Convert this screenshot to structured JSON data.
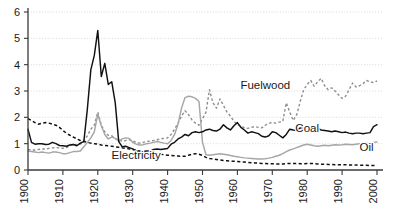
{
  "chart_data": {
    "type": "line",
    "title": "",
    "subtitle": "",
    "xlabel": "",
    "ylabel": "",
    "xlim": [
      1900,
      2000
    ],
    "ylim": [
      0,
      6
    ],
    "yticks": [
      0,
      1,
      2,
      3,
      4,
      5,
      6
    ],
    "ytick_labels": [
      "0",
      "1",
      "2",
      "3",
      "4",
      "5",
      "6"
    ],
    "xticks": [
      1900,
      1910,
      1920,
      1930,
      1940,
      1950,
      1960,
      1970,
      1980,
      1990,
      2000
    ],
    "xtick_labels": [
      "1900",
      "1910",
      "1920",
      "1930",
      "1940",
      "1950",
      "1960",
      "1970",
      "1980",
      "1990",
      "2000"
    ],
    "xtick_rotation": -90,
    "grid": "horizontal-dotted",
    "legend_position": "inline-annotations",
    "annotations": [
      {
        "text": "Fuelwood",
        "x": 1968,
        "y": 3.08,
        "name": "series-label-fuelwood"
      },
      {
        "text": "Coal",
        "x": 1980,
        "y": 1.45,
        "name": "series-label-coal"
      },
      {
        "text": "Oil",
        "x": 1997,
        "y": 0.72,
        "name": "series-label-oil"
      },
      {
        "text": "Electricity",
        "x": 1931,
        "y": 0.4,
        "name": "series-label-electricity"
      }
    ],
    "series": [
      {
        "name": "Coal",
        "style": "solid",
        "color": "#111111",
        "x": [
          1900,
          1901,
          1902,
          1903,
          1904,
          1905,
          1906,
          1907,
          1908,
          1909,
          1910,
          1911,
          1912,
          1913,
          1914,
          1915,
          1916,
          1917,
          1918,
          1919,
          1920,
          1921,
          1922,
          1923,
          1924,
          1925,
          1926,
          1927,
          1928,
          1929,
          1930,
          1931,
          1932,
          1933,
          1934,
          1935,
          1936,
          1937,
          1938,
          1939,
          1940,
          1941,
          1942,
          1943,
          1944,
          1945,
          1946,
          1947,
          1948,
          1949,
          1950,
          1951,
          1952,
          1953,
          1954,
          1955,
          1956,
          1957,
          1958,
          1959,
          1960,
          1961,
          1962,
          1963,
          1964,
          1965,
          1966,
          1967,
          1968,
          1969,
          1970,
          1971,
          1972,
          1973,
          1974,
          1975,
          1976,
          1977,
          1978,
          1979,
          1980,
          1981,
          1982,
          1983,
          1984,
          1985,
          1986,
          1987,
          1988,
          1989,
          1990,
          1991,
          1992,
          1993,
          1994,
          1995,
          1996,
          1997,
          1998,
          1999,
          2000
        ],
        "values": [
          1.55,
          1.05,
          0.98,
          1.0,
          1.0,
          0.97,
          0.98,
          1.05,
          1.0,
          0.93,
          0.92,
          0.9,
          0.95,
          0.97,
          0.92,
          1.02,
          1.08,
          2.3,
          3.8,
          4.35,
          5.3,
          3.55,
          4.05,
          3.25,
          3.35,
          2.55,
          1.08,
          0.88,
          0.9,
          0.85,
          0.8,
          0.72,
          0.7,
          0.7,
          0.72,
          0.72,
          0.78,
          0.8,
          0.78,
          0.8,
          0.82,
          0.98,
          1.05,
          1.18,
          1.25,
          1.35,
          1.3,
          1.42,
          1.45,
          1.42,
          1.45,
          1.52,
          1.55,
          1.5,
          1.48,
          1.55,
          1.72,
          1.6,
          1.52,
          1.68,
          1.8,
          1.62,
          1.52,
          1.4,
          1.45,
          1.42,
          1.38,
          1.28,
          1.25,
          1.3,
          1.45,
          1.42,
          1.32,
          1.22,
          1.35,
          1.55,
          1.52,
          1.5,
          1.6,
          1.58,
          1.48,
          1.6,
          1.65,
          1.58,
          1.52,
          1.5,
          1.48,
          1.45,
          1.48,
          1.45,
          1.42,
          1.44,
          1.4,
          1.38,
          1.4,
          1.4,
          1.38,
          1.4,
          1.42,
          1.65,
          1.72
        ]
      },
      {
        "name": "Oil",
        "style": "solid",
        "color": "#a6a6a6",
        "x": [
          1900,
          1901,
          1902,
          1903,
          1904,
          1905,
          1906,
          1907,
          1908,
          1909,
          1910,
          1911,
          1912,
          1913,
          1914,
          1915,
          1916,
          1917,
          1918,
          1919,
          1920,
          1921,
          1922,
          1923,
          1924,
          1925,
          1926,
          1927,
          1928,
          1929,
          1930,
          1931,
          1932,
          1933,
          1934,
          1935,
          1936,
          1937,
          1938,
          1939,
          1940,
          1941,
          1942,
          1943,
          1944,
          1945,
          1946,
          1947,
          1948,
          1949,
          1950,
          1951,
          1952,
          1953,
          1954,
          1955,
          1956,
          1957,
          1958,
          1959,
          1960,
          1961,
          1962,
          1963,
          1964,
          1965,
          1966,
          1967,
          1968,
          1969,
          1970,
          1971,
          1972,
          1973,
          1974,
          1975,
          1976,
          1977,
          1978,
          1979,
          1980,
          1981,
          1982,
          1983,
          1984,
          1985,
          1986,
          1987,
          1988,
          1989,
          1990,
          1991,
          1992,
          1993,
          1994,
          1995,
          1996,
          1997,
          1998,
          1999,
          2000
        ],
        "values": [
          0.72,
          0.7,
          0.68,
          0.66,
          0.68,
          0.66,
          0.64,
          0.68,
          0.68,
          0.66,
          0.62,
          0.62,
          0.66,
          0.7,
          0.7,
          0.72,
          0.88,
          1.05,
          1.22,
          1.45,
          2.12,
          1.68,
          1.35,
          1.18,
          1.25,
          1.2,
          1.1,
          1.18,
          1.22,
          1.2,
          1.05,
          0.98,
          0.95,
          0.96,
          1.0,
          1.02,
          1.05,
          1.08,
          1.05,
          1.02,
          1.0,
          1.12,
          1.35,
          1.75,
          2.35,
          2.75,
          2.8,
          2.78,
          2.72,
          2.6,
          1.05,
          0.58,
          0.56,
          0.58,
          0.6,
          0.62,
          0.6,
          0.58,
          0.55,
          0.52,
          0.5,
          0.48,
          0.46,
          0.45,
          0.44,
          0.43,
          0.42,
          0.42,
          0.43,
          0.45,
          0.48,
          0.52,
          0.56,
          0.62,
          0.7,
          0.76,
          0.8,
          0.85,
          0.9,
          0.95,
          0.98,
          0.95,
          0.92,
          0.9,
          0.92,
          0.94,
          0.92,
          0.94,
          0.96,
          0.95,
          0.96,
          0.98,
          0.97,
          0.96,
          0.98,
          1.0,
          1.0,
          1.02,
          1.02,
          1.05,
          1.06
        ]
      },
      {
        "name": "Electricity",
        "style": "dashed",
        "color": "#111111",
        "x": [
          1900,
          1901,
          1902,
          1903,
          1904,
          1905,
          1906,
          1907,
          1908,
          1909,
          1910,
          1911,
          1912,
          1913,
          1914,
          1915,
          1916,
          1917,
          1918,
          1919,
          1920,
          1921,
          1922,
          1923,
          1924,
          1925,
          1926,
          1927,
          1928,
          1929,
          1930,
          1931,
          1932,
          1933,
          1934,
          1935,
          1936,
          1937,
          1938,
          1939,
          1940,
          1941,
          1942,
          1943,
          1944,
          1945,
          1946,
          1947,
          1948,
          1949,
          1950,
          1951,
          1952,
          1953,
          1954,
          1955,
          1956,
          1957,
          1958,
          1959,
          1960,
          1961,
          1962,
          1963,
          1964,
          1965,
          1966,
          1967,
          1968,
          1969,
          1970,
          1971,
          1972,
          1973,
          1974,
          1975,
          1976,
          1977,
          1978,
          1979,
          1980,
          1981,
          1982,
          1983,
          1984,
          1985,
          1986,
          1987,
          1988,
          1989,
          1990,
          1991,
          1992,
          1993,
          1994,
          1995,
          1996,
          1997,
          1998,
          1999,
          2000
        ],
        "values": [
          1.95,
          1.88,
          1.8,
          1.74,
          1.78,
          1.8,
          1.78,
          1.74,
          1.7,
          1.62,
          1.5,
          1.4,
          1.32,
          1.25,
          1.18,
          1.12,
          1.08,
          1.05,
          1.02,
          1.0,
          0.98,
          0.95,
          0.93,
          0.92,
          0.9,
          0.88,
          0.86,
          0.84,
          0.82,
          0.8,
          0.78,
          0.75,
          0.72,
          0.7,
          0.68,
          0.66,
          0.64,
          0.62,
          0.6,
          0.58,
          0.56,
          0.55,
          0.54,
          0.53,
          0.52,
          0.52,
          0.56,
          0.6,
          0.62,
          0.6,
          0.55,
          0.48,
          0.44,
          0.42,
          0.4,
          0.38,
          0.36,
          0.35,
          0.34,
          0.33,
          0.32,
          0.31,
          0.3,
          0.29,
          0.28,
          0.27,
          0.26,
          0.25,
          0.25,
          0.24,
          0.24,
          0.23,
          0.23,
          0.23,
          0.24,
          0.25,
          0.25,
          0.25,
          0.24,
          0.24,
          0.25,
          0.25,
          0.24,
          0.23,
          0.22,
          0.22,
          0.21,
          0.21,
          0.2,
          0.2,
          0.2,
          0.2,
          0.19,
          0.19,
          0.19,
          0.18,
          0.18,
          0.18,
          0.17,
          0.17,
          0.17
        ]
      },
      {
        "name": "Fuelwood",
        "style": "dotted",
        "color": "#8f8f8f",
        "x": [
          1900,
          1901,
          1902,
          1903,
          1904,
          1905,
          1906,
          1907,
          1908,
          1909,
          1910,
          1911,
          1912,
          1913,
          1914,
          1915,
          1916,
          1917,
          1918,
          1919,
          1920,
          1921,
          1922,
          1923,
          1924,
          1925,
          1926,
          1927,
          1928,
          1929,
          1930,
          1931,
          1932,
          1933,
          1934,
          1935,
          1936,
          1937,
          1938,
          1939,
          1940,
          1941,
          1942,
          1943,
          1944,
          1945,
          1946,
          1947,
          1948,
          1949,
          1950,
          1951,
          1952,
          1953,
          1954,
          1955,
          1956,
          1957,
          1958,
          1959,
          1960,
          1961,
          1962,
          1963,
          1964,
          1965,
          1966,
          1967,
          1968,
          1969,
          1970,
          1971,
          1972,
          1973,
          1974,
          1975,
          1976,
          1977,
          1978,
          1979,
          1980,
          1981,
          1982,
          1983,
          1984,
          1985,
          1986,
          1987,
          1988,
          1989,
          1990,
          1991,
          1992,
          1993,
          1994,
          1995,
          1996,
          1997,
          1998,
          1999,
          2000
        ],
        "values": [
          0.78,
          0.76,
          0.76,
          0.78,
          0.8,
          0.8,
          0.82,
          0.84,
          0.85,
          0.84,
          0.82,
          0.85,
          0.92,
          0.98,
          0.95,
          0.98,
          1.1,
          1.3,
          1.55,
          1.7,
          2.2,
          1.7,
          1.45,
          1.32,
          1.3,
          1.2,
          1.12,
          1.1,
          1.12,
          1.15,
          1.1,
          1.05,
          1.02,
          1.05,
          1.08,
          1.1,
          1.12,
          1.15,
          1.18,
          1.2,
          1.22,
          1.35,
          1.55,
          1.78,
          2.05,
          2.25,
          2.1,
          1.9,
          1.78,
          1.7,
          1.95,
          2.2,
          3.05,
          2.55,
          2.35,
          2.7,
          2.45,
          2.2,
          2.05,
          1.85,
          1.72,
          1.68,
          1.6,
          1.58,
          1.62,
          1.65,
          1.62,
          1.6,
          1.7,
          1.78,
          1.8,
          1.78,
          1.82,
          1.85,
          2.55,
          2.2,
          1.88,
          2.1,
          2.6,
          3.05,
          3.25,
          3.4,
          3.18,
          3.35,
          3.48,
          3.2,
          3.05,
          3.12,
          3.0,
          2.85,
          2.72,
          2.8,
          3.05,
          3.3,
          3.15,
          3.2,
          3.28,
          3.4,
          3.35,
          3.32,
          3.38
        ]
      }
    ]
  },
  "plot": {
    "left": 28,
    "right": 377,
    "top": 12,
    "bottom": 170
  }
}
